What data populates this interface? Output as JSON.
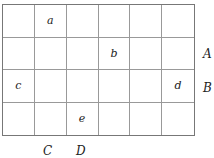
{
  "grid": {
    "rows": 4,
    "cols": 6,
    "cells": [
      [
        "",
        "a",
        "",
        "",
        "",
        ""
      ],
      [
        "",
        "",
        "",
        "b",
        "",
        ""
      ],
      [
        "c",
        "",
        "",
        "",
        "",
        "d"
      ],
      [
        "",
        "",
        "e",
        "",
        "",
        ""
      ]
    ]
  },
  "labels": {
    "A": "A",
    "B": "B",
    "C": "C",
    "D": "D"
  }
}
